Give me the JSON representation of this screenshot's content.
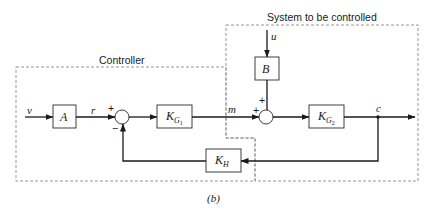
{
  "diagram": {
    "type": "block-diagram",
    "caption": "(b)",
    "regions": {
      "controller": {
        "label": "Controller"
      },
      "system": {
        "label": "System to be controlled"
      }
    },
    "blocks": {
      "A": {
        "label": "A"
      },
      "KG1": {
        "label": "K",
        "subscript": "G",
        "subsub": "1"
      },
      "B": {
        "label": "B"
      },
      "KG2": {
        "label": "K",
        "subscript": "G",
        "subsub": "2"
      },
      "KH": {
        "label": "K",
        "subscript": "H"
      }
    },
    "signals": {
      "v": "v",
      "r": "r",
      "m": "m",
      "u": "u",
      "c": "c"
    },
    "junctions": {
      "sum1": {
        "plus": "+",
        "minus": "−"
      },
      "sum2": {
        "plus_left": "+",
        "plus_top": "+"
      }
    },
    "connections": [
      {
        "from": "v",
        "to": "A"
      },
      {
        "from": "A",
        "to": "sum1",
        "signal": "r",
        "sign": "+"
      },
      {
        "from": "sum1",
        "to": "KG1"
      },
      {
        "from": "KG1",
        "to": "sum2",
        "signal": "m",
        "sign": "+"
      },
      {
        "from": "u",
        "to": "B"
      },
      {
        "from": "B",
        "to": "sum2",
        "sign": "+"
      },
      {
        "from": "sum2",
        "to": "KG2"
      },
      {
        "from": "KG2",
        "to": "output",
        "signal": "c"
      },
      {
        "from": "c",
        "to": "KH"
      },
      {
        "from": "KH",
        "to": "sum1",
        "sign": "−"
      }
    ]
  }
}
